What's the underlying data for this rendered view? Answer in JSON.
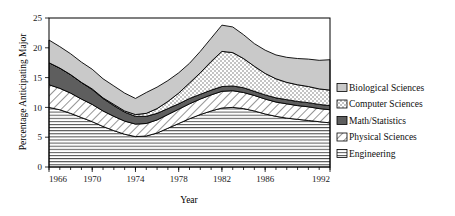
{
  "chart_data": {
    "type": "area",
    "stacked": true,
    "title": "",
    "xlabel": "Year",
    "ylabel": "Percentage Anticipating Major",
    "xlim": [
      1966,
      1992
    ],
    "ylim": [
      0,
      25
    ],
    "yticks": [
      0,
      5,
      10,
      15,
      20,
      25
    ],
    "xticks": [
      1966,
      1970,
      1974,
      1978,
      1982,
      1986,
      1992
    ],
    "xtick_labels": [
      "1966",
      "1970",
      "1974",
      "1978",
      "1982",
      "1986",
      "1992"
    ],
    "grid": false,
    "legend_position": "right",
    "x": [
      1966,
      1967,
      1968,
      1969,
      1970,
      1971,
      1972,
      1973,
      1974,
      1975,
      1976,
      1977,
      1978,
      1979,
      1980,
      1981,
      1982,
      1983,
      1984,
      1985,
      1986,
      1987,
      1988,
      1989,
      1990,
      1991,
      1992
    ],
    "series": [
      {
        "name": "Engineering",
        "pattern": "horizontal-lines",
        "color": "#f2f2f2",
        "values": [
          10.0,
          9.6,
          9.0,
          8.3,
          7.6,
          6.8,
          6.1,
          5.5,
          5.1,
          5.2,
          5.7,
          6.5,
          7.3,
          8.1,
          8.8,
          9.4,
          9.9,
          10.0,
          9.8,
          9.4,
          8.9,
          8.5,
          8.2,
          8.0,
          7.8,
          7.6,
          7.4
        ]
      },
      {
        "name": "Physical Sciences",
        "pattern": "diagonal-hatch",
        "color": "#ffffff",
        "values": [
          3.8,
          3.6,
          3.4,
          3.1,
          2.9,
          2.6,
          2.4,
          2.2,
          2.1,
          2.1,
          2.2,
          2.3,
          2.4,
          2.5,
          2.6,
          2.7,
          2.8,
          2.8,
          2.7,
          2.6,
          2.5,
          2.4,
          2.4,
          2.3,
          2.3,
          2.2,
          2.2
        ]
      },
      {
        "name": "Math/Statistics",
        "pattern": "solid-dark",
        "color": "#595959",
        "values": [
          3.7,
          3.4,
          3.1,
          2.8,
          2.5,
          2.1,
          1.8,
          1.5,
          1.3,
          1.2,
          1.1,
          1.0,
          0.9,
          0.9,
          0.8,
          0.8,
          0.8,
          0.8,
          0.8,
          0.7,
          0.7,
          0.7,
          0.7,
          0.7,
          0.7,
          0.7,
          0.7
        ]
      },
      {
        "name": "Computer Sciences",
        "pattern": "dotted",
        "color": "#ffffff",
        "values": [
          0.0,
          0.0,
          0.0,
          0.0,
          0.1,
          0.1,
          0.2,
          0.2,
          0.3,
          0.5,
          0.8,
          1.2,
          1.8,
          2.6,
          3.6,
          4.8,
          5.9,
          5.6,
          4.9,
          4.2,
          3.6,
          3.2,
          2.9,
          2.8,
          2.7,
          2.6,
          2.6
        ]
      },
      {
        "name": "Biological Sciences",
        "pattern": "light-gray",
        "color": "#c8c8c8",
        "values": [
          3.8,
          3.6,
          3.5,
          3.4,
          3.3,
          3.2,
          3.1,
          3.0,
          2.7,
          3.5,
          3.6,
          3.5,
          3.4,
          3.3,
          3.6,
          3.9,
          4.4,
          4.3,
          4.0,
          3.8,
          3.9,
          4.0,
          4.2,
          4.4,
          4.6,
          4.8,
          5.1
        ]
      }
    ],
    "legend": [
      {
        "label": "Biological Sciences",
        "pattern": "light-gray"
      },
      {
        "label": "Computer Sciences",
        "pattern": "dotted"
      },
      {
        "label": "Math/Statistics",
        "pattern": "solid-dark"
      },
      {
        "label": "Physical Sciences",
        "pattern": "diagonal-hatch"
      },
      {
        "label": "Engineering",
        "pattern": "horizontal-lines"
      }
    ]
  }
}
